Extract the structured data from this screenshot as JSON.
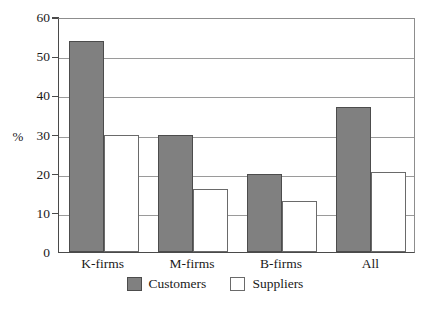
{
  "chart_data": {
    "type": "bar",
    "title": "",
    "xlabel": "",
    "ylabel": "%",
    "ylim": [
      0,
      60
    ],
    "yticks": [
      0,
      10,
      20,
      30,
      40,
      50,
      60
    ],
    "grid": true,
    "legend_position": "bottom-center",
    "categories": [
      "K-firms",
      "M-firms",
      "B-firms",
      "All"
    ],
    "series": [
      {
        "name": "Customers",
        "color": "#808080",
        "values": [
          54,
          30,
          20,
          37
        ]
      },
      {
        "name": "Suppliers",
        "color": "#ffffff",
        "values": [
          30,
          16,
          13,
          20.5
        ]
      }
    ]
  }
}
